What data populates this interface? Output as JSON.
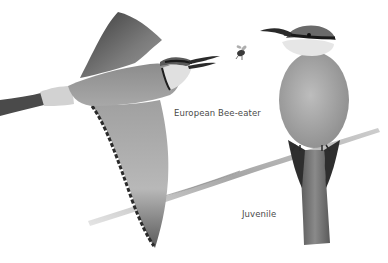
{
  "illustration": {
    "subject": "European Bee-eater",
    "style": "grayscale pencil illustration",
    "figures": [
      {
        "name": "flying-adult",
        "pose": "flying, wings spread, bill open toward bee"
      },
      {
        "name": "perched-juvenile",
        "pose": "perched on branch, facing left"
      },
      {
        "name": "bee",
        "pose": "flying insect near bill"
      },
      {
        "name": "branch",
        "pose": "diagonal twig from lower-left to right"
      }
    ]
  },
  "captions": {
    "adult": "European Bee-eater",
    "juvenile": "Juvenile"
  },
  "colors": {
    "background": "#ffffff",
    "caption_text": "#4a4a4a",
    "dark_plumage": "#2a2a2a",
    "mid_plumage": "#8a8a8a",
    "light_plumage": "#d4d4d4",
    "branch": "#a8a8a8"
  }
}
